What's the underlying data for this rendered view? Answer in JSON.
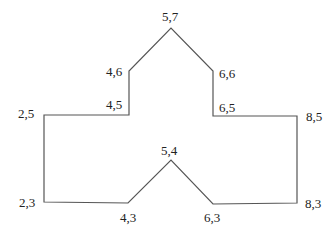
{
  "diagram": {
    "type": "polygon-outline",
    "stroke_color": "#555555",
    "background": "#ffffff",
    "vertices": [
      {
        "label": "2,5",
        "x": 2,
        "y": 5,
        "px": 44,
        "py": 115,
        "lx": 18,
        "ly": 118
      },
      {
        "label": "4,5",
        "x": 4,
        "y": 5,
        "px": 129,
        "py": 115,
        "lx": 106,
        "ly": 109
      },
      {
        "label": "4,6",
        "x": 4,
        "y": 6,
        "px": 129,
        "py": 71,
        "lx": 106,
        "ly": 76
      },
      {
        "label": "5,7",
        "x": 5,
        "y": 7,
        "px": 171,
        "py": 28,
        "lx": 162,
        "ly": 21
      },
      {
        "label": "6,6",
        "x": 6,
        "y": 6,
        "px": 213,
        "py": 71,
        "lx": 219,
        "ly": 78
      },
      {
        "label": "6,5",
        "x": 6,
        "y": 5,
        "px": 213,
        "py": 116,
        "lx": 219,
        "ly": 112
      },
      {
        "label": "8,5",
        "x": 8,
        "y": 5,
        "px": 297,
        "py": 116,
        "lx": 306,
        "ly": 121
      },
      {
        "label": "8,3",
        "x": 8,
        "y": 3,
        "px": 297,
        "py": 203,
        "lx": 305,
        "ly": 208
      },
      {
        "label": "6,3",
        "x": 6,
        "y": 3,
        "px": 213,
        "py": 204,
        "lx": 204,
        "ly": 222
      },
      {
        "label": "5,4",
        "x": 5,
        "y": 4,
        "px": 171,
        "py": 160,
        "lx": 161,
        "ly": 155
      },
      {
        "label": "4,3",
        "x": 4,
        "y": 3,
        "px": 128,
        "py": 203,
        "lx": 120,
        "ly": 222
      },
      {
        "label": "2,3",
        "x": 2,
        "y": 3,
        "px": 44,
        "py": 202,
        "lx": 19,
        "ly": 207
      }
    ]
  },
  "labels": {
    "v_2_5": "2,5",
    "v_4_5": "4,5",
    "v_4_6": "4,6",
    "v_5_7": "5,7",
    "v_6_6": "6,6",
    "v_6_5": "6,5",
    "v_8_5": "8,5",
    "v_8_3": "8,3",
    "v_6_3": "6,3",
    "v_5_4": "5,4",
    "v_4_3": "4,3",
    "v_2_3": "2,3"
  }
}
